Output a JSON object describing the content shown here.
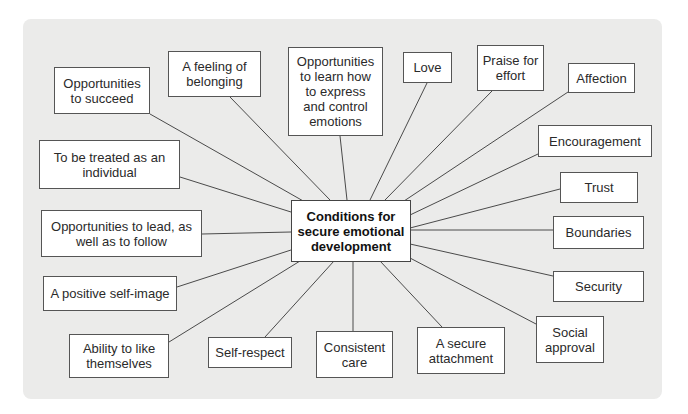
{
  "diagram": {
    "center": {
      "label": "Conditions for secure emotional development"
    },
    "nodes": [
      {
        "id": "opportunities-to-succeed",
        "label": "Opportunities to succeed"
      },
      {
        "id": "feeling-of-belonging",
        "label": "A feeling of belonging"
      },
      {
        "id": "learn-express-control-emotions",
        "label": "Opportunities to learn how to express and control emotions"
      },
      {
        "id": "love",
        "label": "Love"
      },
      {
        "id": "praise-for-effort",
        "label": "Praise for effort"
      },
      {
        "id": "affection",
        "label": "Affection"
      },
      {
        "id": "encouragement",
        "label": "Encouragement"
      },
      {
        "id": "trust",
        "label": "Trust"
      },
      {
        "id": "treated-as-individual",
        "label": "To be treated as an individual"
      },
      {
        "id": "lead-and-follow",
        "label": "Opportunities to lead, as well as to follow"
      },
      {
        "id": "boundaries",
        "label": "Boundaries"
      },
      {
        "id": "positive-self-image",
        "label": "A positive self-image"
      },
      {
        "id": "security",
        "label": "Security"
      },
      {
        "id": "ability-to-like-themselves",
        "label": "Ability to like themselves"
      },
      {
        "id": "self-respect",
        "label": "Self-respect"
      },
      {
        "id": "consistent-care",
        "label": "Consistent care"
      },
      {
        "id": "secure-attachment",
        "label": "A secure attachment"
      },
      {
        "id": "social-approval",
        "label": "Social approval"
      }
    ]
  },
  "colors": {
    "panel": "#ebebea",
    "box": "#ffffff",
    "line": "#4a4a4a"
  }
}
